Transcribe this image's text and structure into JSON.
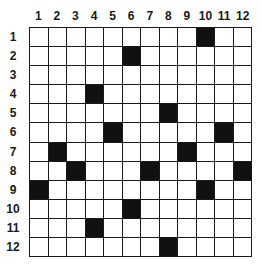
{
  "grid": {
    "rows": 12,
    "cols": 12,
    "column_labels": [
      "1",
      "2",
      "3",
      "4",
      "5",
      "6",
      "7",
      "8",
      "9",
      "10",
      "11",
      "12"
    ],
    "row_labels": [
      "1",
      "2",
      "3",
      "4",
      "5",
      "6",
      "7",
      "8",
      "9",
      "10",
      "11",
      "12"
    ],
    "black_cells": [
      {
        "row": 1,
        "col": 10
      },
      {
        "row": 2,
        "col": 6
      },
      {
        "row": 4,
        "col": 4
      },
      {
        "row": 5,
        "col": 8
      },
      {
        "row": 6,
        "col": 5
      },
      {
        "row": 6,
        "col": 11
      },
      {
        "row": 7,
        "col": 2
      },
      {
        "row": 7,
        "col": 9
      },
      {
        "row": 8,
        "col": 3
      },
      {
        "row": 8,
        "col": 7
      },
      {
        "row": 8,
        "col": 12
      },
      {
        "row": 9,
        "col": 1
      },
      {
        "row": 9,
        "col": 10
      },
      {
        "row": 10,
        "col": 6
      },
      {
        "row": 11,
        "col": 4
      },
      {
        "row": 12,
        "col": 8
      }
    ],
    "colors": {
      "line": "#1a1a1a",
      "black_cell": "#111111",
      "white_cell": "#ffffff"
    }
  }
}
